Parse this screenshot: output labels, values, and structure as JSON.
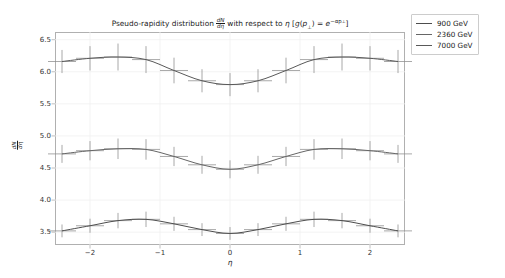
{
  "chart_data": {
    "type": "line",
    "title_parts": {
      "lead": "Pseudo-rapidity distribution",
      "frac_num": "dN",
      "frac_den": "dη",
      "middle": "with respect to",
      "eta": "η",
      "bracket_open": "[",
      "g": "g",
      "paren_open": "(",
      "p": "p",
      "perp": "⊥",
      "paren_close": ")",
      "equals": "=",
      "e": "e",
      "exponent": "−αp",
      "exponent_sub": "⊥",
      "bracket_close": "]"
    },
    "xlabel": "η",
    "ylabel": "dN/dη",
    "ylabel_num": "dN",
    "ylabel_den": "dη",
    "xlim": [
      -2.5,
      2.5
    ],
    "ylim": [
      3.3,
      6.62
    ],
    "xticks": [
      -2,
      -1,
      0,
      1,
      2
    ],
    "xtick_labels": [
      "−2",
      "−1",
      "0",
      "1",
      "2"
    ],
    "yticks": [
      3.5,
      4.0,
      4.5,
      5.0,
      5.5,
      6.0,
      6.5
    ],
    "ytick_labels": [
      "3.5",
      "4.0",
      "4.5",
      "5.0",
      "5.5",
      "6.0",
      "6.5"
    ],
    "grid": true,
    "legend_position": "upper right",
    "x": [
      -2.4,
      -2.0,
      -1.6,
      -1.2,
      -0.8,
      -0.4,
      0.0,
      0.4,
      0.8,
      1.2,
      1.6,
      2.0,
      2.4
    ],
    "series": [
      {
        "name": "900 GeV",
        "color": "#4d4d4d",
        "values": [
          3.52,
          3.6,
          3.68,
          3.7,
          3.63,
          3.54,
          3.48,
          3.54,
          3.63,
          3.7,
          3.68,
          3.6,
          3.52
        ],
        "yerr": [
          0.1,
          0.11,
          0.12,
          0.12,
          0.11,
          0.1,
          0.1,
          0.1,
          0.11,
          0.12,
          0.12,
          0.11,
          0.1
        ],
        "xerr": [
          0.2,
          0.2,
          0.2,
          0.2,
          0.2,
          0.2,
          0.2,
          0.2,
          0.2,
          0.2,
          0.2,
          0.2,
          0.2
        ]
      },
      {
        "name": "2360 GeV",
        "color": "#666666",
        "values": [
          4.72,
          4.77,
          4.8,
          4.79,
          4.68,
          4.55,
          4.48,
          4.55,
          4.68,
          4.79,
          4.8,
          4.77,
          4.72
        ],
        "yerr": [
          0.14,
          0.15,
          0.16,
          0.16,
          0.15,
          0.14,
          0.14,
          0.14,
          0.15,
          0.16,
          0.16,
          0.15,
          0.14
        ],
        "xerr": [
          0.2,
          0.2,
          0.2,
          0.2,
          0.2,
          0.2,
          0.2,
          0.2,
          0.2,
          0.2,
          0.2,
          0.2,
          0.2
        ]
      },
      {
        "name": "7000 GeV",
        "color": "#595959",
        "values": [
          6.16,
          6.21,
          6.23,
          6.19,
          6.02,
          5.86,
          5.8,
          5.86,
          6.02,
          6.19,
          6.23,
          6.21,
          6.16
        ],
        "yerr": [
          0.18,
          0.19,
          0.21,
          0.21,
          0.2,
          0.18,
          0.18,
          0.18,
          0.2,
          0.21,
          0.21,
          0.19,
          0.18
        ],
        "xerr": [
          0.2,
          0.2,
          0.2,
          0.2,
          0.2,
          0.2,
          0.2,
          0.2,
          0.2,
          0.2,
          0.2,
          0.2,
          0.2
        ]
      }
    ]
  },
  "legend": {
    "items": [
      {
        "label": "900 GeV",
        "color": "#4d4d4d"
      },
      {
        "label": "2360 GeV",
        "color": "#666666"
      },
      {
        "label": "7000 GeV",
        "color": "#595959"
      }
    ]
  },
  "colors": {
    "background": "#ffffff",
    "axis": "#b0b0b0",
    "grid": "#f0f0f0",
    "text": "#1a1a1a",
    "errorbar": "#8c8c8c"
  }
}
